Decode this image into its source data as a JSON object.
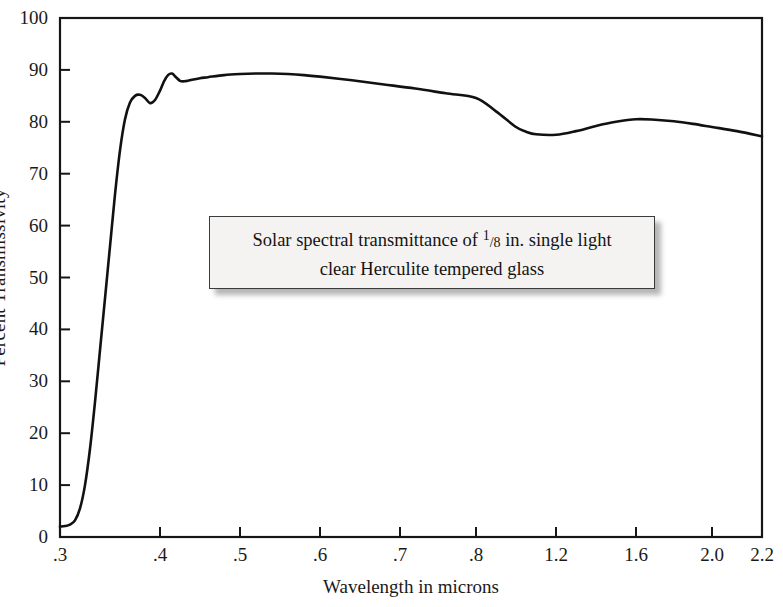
{
  "chart_data": {
    "type": "line",
    "title": "",
    "xlabel": "Wavelength in microns",
    "ylabel": "Percent Transmissivity",
    "xtick_labels": [
      ".3",
      ".4",
      ".5",
      ".6",
      ".7",
      ".8",
      "1.2",
      "1.6",
      "2.0",
      "2.2"
    ],
    "xtick_values": [
      0.3,
      0.4,
      0.5,
      0.6,
      0.7,
      0.8,
      1.2,
      1.6,
      2.0,
      2.2
    ],
    "xtick_pixels": [
      60,
      160,
      240,
      320,
      400,
      476,
      556,
      636,
      712,
      762
    ],
    "ytick_labels": [
      "0",
      "10",
      "20",
      "30",
      "40",
      "50",
      "60",
      "70",
      "80",
      "90",
      "100"
    ],
    "ytick_values": [
      0,
      10,
      20,
      30,
      40,
      50,
      60,
      70,
      80,
      90,
      100
    ],
    "ylim": [
      0,
      100
    ],
    "grid": false,
    "legend": null,
    "series": [
      {
        "name": "Solar spectral transmittance, 1/8 in. clear Herculite tempered glass",
        "color": "#111111",
        "x": [
          0.3,
          0.305,
          0.31,
          0.315,
          0.32,
          0.325,
          0.33,
          0.335,
          0.34,
          0.345,
          0.35,
          0.355,
          0.36,
          0.365,
          0.37,
          0.375,
          0.38,
          0.385,
          0.39,
          0.395,
          0.4,
          0.405,
          0.41,
          0.415,
          0.42,
          0.425,
          0.43,
          0.435,
          0.44,
          0.45,
          0.46,
          0.48,
          0.5,
          0.52,
          0.54,
          0.56,
          0.58,
          0.6,
          0.64,
          0.68,
          0.72,
          0.76,
          0.8,
          0.9,
          1.0,
          1.05,
          1.1,
          1.2,
          1.3,
          1.4,
          1.5,
          1.6,
          1.7,
          1.8,
          1.9,
          2.0,
          2.1,
          2.2
        ],
        "y": [
          2.0,
          2.1,
          2.4,
          3.2,
          5.5,
          10.0,
          17.0,
          26.0,
          36.0,
          46.0,
          56.0,
          66.0,
          74.5,
          80.5,
          83.7,
          85.0,
          85.2,
          84.6,
          83.6,
          84.2,
          86.0,
          87.8,
          89.0,
          89.3,
          88.6,
          87.9,
          87.8,
          87.9,
          88.1,
          88.4,
          88.6,
          89.0,
          89.2,
          89.3,
          89.3,
          89.2,
          89.0,
          88.7,
          88.0,
          87.2,
          86.4,
          85.5,
          84.6,
          82.0,
          79.0,
          78.1,
          77.6,
          77.5,
          78.2,
          79.2,
          80.0,
          80.5,
          80.4,
          80.1,
          79.6,
          79.0,
          78.2,
          77.2
        ]
      }
    ],
    "annotation": {
      "line1_prefix": "Solar spectral transmittance of ",
      "fraction_num": "1",
      "fraction_sep": "/",
      "fraction_den": "8",
      "line1_suffix": " in. single light",
      "line2": "clear Herculite tempered glass",
      "full_text": "Solar spectral transmittance of 1/8 in. single light clear Herculite tempered glass"
    },
    "axes": {
      "frame_color": "#161616",
      "plot_left_px": 60,
      "plot_right_px": 762,
      "plot_top_px": 18,
      "plot_bottom_px": 537
    }
  }
}
